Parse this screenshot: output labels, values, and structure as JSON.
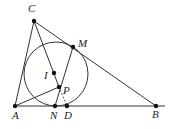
{
  "diagram": {
    "points": [
      {
        "id": "C",
        "label": "C"
      },
      {
        "id": "M",
        "label": "M"
      },
      {
        "id": "I",
        "label": "I"
      },
      {
        "id": "P",
        "label": "P"
      },
      {
        "id": "A",
        "label": "A"
      },
      {
        "id": "N",
        "label": "N"
      },
      {
        "id": "D",
        "label": "D"
      },
      {
        "id": "B",
        "label": "B"
      }
    ],
    "segments": [
      "C-A",
      "C-B",
      "A-B",
      "C-P",
      "M-N",
      "A-P"
    ],
    "dotted_segments": [
      "P-D"
    ],
    "circle": {
      "center": "I",
      "tangent_points": [
        "N",
        "M"
      ]
    }
  }
}
